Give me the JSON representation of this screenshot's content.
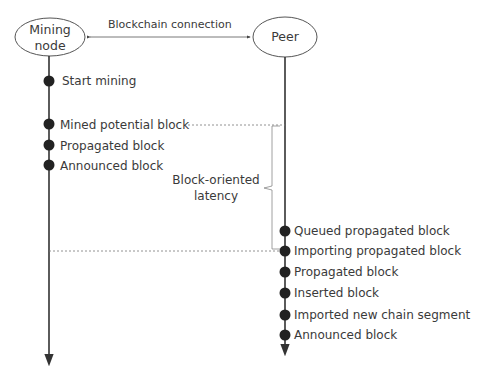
{
  "diagram": {
    "type": "sequence-timeline",
    "nodes": [
      {
        "id": "mining-node",
        "label_line1": "Mining",
        "label_line2": "node"
      },
      {
        "id": "peer",
        "label": "Peer"
      }
    ],
    "connection_label": "Blockchain connection",
    "mining_events": [
      "Start mining",
      "Mined potential block",
      "Propagated block",
      "Announced block"
    ],
    "peer_events": [
      "Queued propagated block",
      "Importing propagated block",
      "Propagated block",
      "Inserted block",
      "Imported new chain segment",
      "Announced block"
    ],
    "latency_label_line1": "Block-oriented",
    "latency_label_line2": "latency",
    "colors": {
      "line": "#333333",
      "dot": "#222222",
      "dashed": "#777777",
      "bracket": "#888888"
    }
  }
}
